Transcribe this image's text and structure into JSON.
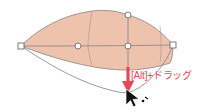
{
  "app": {
    "title": "Vector Path Editing Canvas",
    "background_color": "#ffffff"
  },
  "annotation": {
    "hint_text": "[Alt]+ドラッグ",
    "hint_color": "#e8475a",
    "modifier_key": "[Alt]",
    "action_label": "ドラッグ"
  },
  "shape": {
    "name": "leaf-path",
    "fill_color": "#eec3ae",
    "stroke_color": "#9a8b86",
    "mesh_line_color": "#8d7f7b",
    "outline_color": "#7f8b96"
  },
  "anchors": {
    "square_anchor_fill": "#ffffff",
    "square_anchor_stroke": "#6b6b78",
    "round_anchor_fill": "#ffffff",
    "round_anchor_stroke": "#6b6b78",
    "points": [
      {
        "name": "anchor-left",
        "type": "square",
        "x": 21,
        "y": 46
      },
      {
        "name": "anchor-center-left",
        "type": "round",
        "x": 78,
        "y": 46
      },
      {
        "name": "anchor-center",
        "type": "round",
        "x": 127,
        "y": 46
      },
      {
        "name": "anchor-right",
        "type": "square",
        "x": 173,
        "y": 45
      },
      {
        "name": "anchor-top-center",
        "type": "round",
        "x": 128,
        "y": 15
      },
      {
        "name": "anchor-drag-target",
        "type": "round",
        "x": 128,
        "y": 92
      }
    ]
  },
  "arrow": {
    "name": "drag-direction-arrow",
    "color": "#e8475a",
    "direction": "down",
    "x": 128,
    "y_start": 68,
    "y_end": 92
  },
  "cursor": {
    "name": "pointer-cursor",
    "color": "#000000",
    "x": 128,
    "y": 92
  }
}
